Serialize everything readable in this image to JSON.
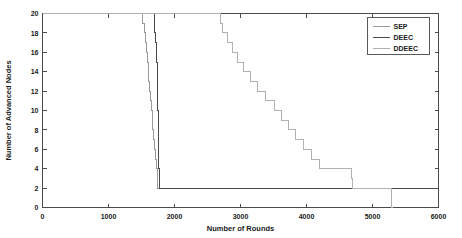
{
  "chart_data": {
    "type": "line",
    "title": "",
    "xlabel": "Number of Rounds",
    "ylabel": "Number of Advanced Nodes",
    "xlim": [
      0,
      6000
    ],
    "ylim": [
      0,
      20
    ],
    "xticks": [
      0,
      1000,
      2000,
      3000,
      4000,
      5000,
      6000
    ],
    "xticklabels": [
      "0",
      "1000",
      "2000",
      "3000",
      "4000",
      "5000",
      "6000"
    ],
    "yticks": [
      0,
      2,
      4,
      6,
      8,
      10,
      12,
      14,
      16,
      18,
      20
    ],
    "yticklabels": [
      "0",
      "2",
      "4",
      "6",
      "8",
      "10",
      "12",
      "14",
      "16",
      "18",
      "20"
    ],
    "grid": false,
    "legend_position": "upper right",
    "series": [
      {
        "name": "SEP",
        "color": "#9a9a9a",
        "points": [
          [
            0,
            20
          ],
          [
            1520,
            20
          ],
          [
            1520,
            19
          ],
          [
            1545,
            19
          ],
          [
            1545,
            18
          ],
          [
            1560,
            18
          ],
          [
            1560,
            17
          ],
          [
            1575,
            17
          ],
          [
            1575,
            16
          ],
          [
            1590,
            16
          ],
          [
            1590,
            15
          ],
          [
            1600,
            15
          ],
          [
            1600,
            14
          ],
          [
            1612,
            14
          ],
          [
            1612,
            13
          ],
          [
            1624,
            13
          ],
          [
            1624,
            12
          ],
          [
            1636,
            12
          ],
          [
            1636,
            11
          ],
          [
            1648,
            11
          ],
          [
            1648,
            10
          ],
          [
            1660,
            10
          ],
          [
            1660,
            9
          ],
          [
            1672,
            9
          ],
          [
            1672,
            8
          ],
          [
            1684,
            8
          ],
          [
            1684,
            7
          ],
          [
            1696,
            7
          ],
          [
            1696,
            6
          ],
          [
            1708,
            6
          ],
          [
            1708,
            5
          ],
          [
            1720,
            5
          ],
          [
            1720,
            4
          ],
          [
            1740,
            4
          ],
          [
            1740,
            2
          ],
          [
            5980,
            2
          ]
        ]
      },
      {
        "name": "DEEC",
        "color": "#4a4a4a",
        "points": [
          [
            0,
            20
          ],
          [
            1690,
            20
          ],
          [
            1690,
            19
          ],
          [
            1700,
            19
          ],
          [
            1700,
            18
          ],
          [
            1712,
            18
          ],
          [
            1712,
            17
          ],
          [
            1722,
            17
          ],
          [
            1722,
            16
          ],
          [
            1730,
            16
          ],
          [
            1730,
            15
          ],
          [
            1736,
            15
          ],
          [
            1736,
            14
          ],
          [
            1742,
            14
          ],
          [
            1742,
            12
          ],
          [
            1748,
            12
          ],
          [
            1748,
            10
          ],
          [
            1752,
            10
          ],
          [
            1752,
            8
          ],
          [
            1756,
            8
          ],
          [
            1756,
            6
          ],
          [
            1760,
            6
          ],
          [
            1760,
            4
          ],
          [
            1766,
            4
          ],
          [
            1766,
            2
          ],
          [
            5990,
            2
          ]
        ]
      },
      {
        "name": "DDEEC",
        "color": "#b0b0b0",
        "points": [
          [
            0,
            20
          ],
          [
            2690,
            20
          ],
          [
            2690,
            19
          ],
          [
            2720,
            19
          ],
          [
            2720,
            18
          ],
          [
            2800,
            18
          ],
          [
            2800,
            17
          ],
          [
            2880,
            17
          ],
          [
            2880,
            16
          ],
          [
            2960,
            16
          ],
          [
            2960,
            15
          ],
          [
            3050,
            15
          ],
          [
            3050,
            14
          ],
          [
            3150,
            14
          ],
          [
            3150,
            13
          ],
          [
            3260,
            13
          ],
          [
            3260,
            12
          ],
          [
            3380,
            12
          ],
          [
            3380,
            11
          ],
          [
            3520,
            11
          ],
          [
            3520,
            10
          ],
          [
            3620,
            10
          ],
          [
            3620,
            9
          ],
          [
            3720,
            9
          ],
          [
            3720,
            8
          ],
          [
            3840,
            8
          ],
          [
            3840,
            7
          ],
          [
            3960,
            7
          ],
          [
            3960,
            6
          ],
          [
            4080,
            6
          ],
          [
            4080,
            5
          ],
          [
            4200,
            5
          ],
          [
            4200,
            4
          ],
          [
            4680,
            4
          ],
          [
            4680,
            3
          ],
          [
            4700,
            3
          ],
          [
            4700,
            2
          ],
          [
            5290,
            2
          ],
          [
            5290,
            0
          ],
          [
            5310,
            0
          ]
        ]
      }
    ]
  },
  "legend": {
    "entries": [
      {
        "label": "SEP"
      },
      {
        "label": "DEEC"
      },
      {
        "label": "DDEEC"
      }
    ]
  }
}
